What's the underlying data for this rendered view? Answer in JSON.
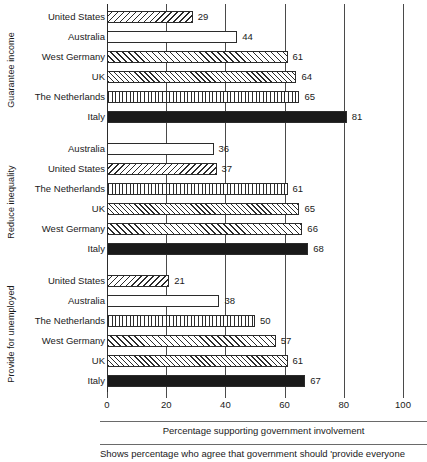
{
  "chart_data": {
    "type": "bar",
    "orientation": "horizontal",
    "title": "",
    "xlabel": "Percentage supporting government involvement",
    "ylabel": "",
    "xlim": [
      0,
      100
    ],
    "xticks": [
      0,
      20,
      40,
      60,
      80,
      100
    ],
    "grid": true,
    "legend": "none",
    "footnote": "Shows percentage who agree that government should 'provide everyone",
    "groups": [
      {
        "label": "Guarantee income",
        "categories": [
          "United States",
          "Australia",
          "West Germany",
          "UK",
          "The Netherlands",
          "Italy"
        ],
        "values": [
          29,
          44,
          61,
          64,
          65,
          81
        ]
      },
      {
        "label": "Reduce inequality",
        "categories": [
          "Australia",
          "United States",
          "The Netherlands",
          "UK",
          "West Germany",
          "Italy"
        ],
        "values": [
          36,
          37,
          61,
          65,
          66,
          68
        ]
      },
      {
        "label": "Provide for unemployed",
        "categories": [
          "United States",
          "Australia",
          "The Netherlands",
          "West Germany",
          "UK",
          "Italy"
        ],
        "values": [
          21,
          38,
          50,
          57,
          61,
          67
        ]
      }
    ],
    "series_patterns": {
      "United States": "diagonal-left-hatch",
      "Australia": "dotted",
      "West Germany": "diagonal-right-hatch",
      "UK": "cross-hatch",
      "The Netherlands": "vertical-lines",
      "Italy": "solid-black"
    },
    "colors": {
      "ink": "#1a1a1a",
      "grid": "#4a4a4a",
      "bar_fill": "#ffffff",
      "italy_fill": "#1a1a1a"
    }
  }
}
